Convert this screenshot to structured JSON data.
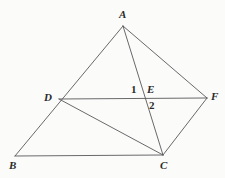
{
  "figure": {
    "canvas": {
      "width": 225,
      "height": 178
    },
    "background_color": "#fbfbfa",
    "stroke_color": "#58585a",
    "stroke_width": 0.9,
    "label_color": "#2b2b2b",
    "points": {
      "A": {
        "label": "A",
        "x": 123,
        "y": 26,
        "label_x": 119,
        "label_y": 9
      },
      "B": {
        "label": "B",
        "x": 15,
        "y": 156,
        "label_x": 9,
        "label_y": 160
      },
      "C": {
        "label": "C",
        "x": 163,
        "y": 155,
        "label_x": 160,
        "label_y": 160
      },
      "D": {
        "label": "D",
        "x": 59,
        "y": 99,
        "label_x": 44,
        "label_y": 92
      },
      "E": {
        "label": "E",
        "x": 144,
        "y": 99,
        "label_x": 147,
        "label_y": 84
      },
      "F": {
        "label": "F",
        "x": 207,
        "y": 98,
        "label_x": 211,
        "label_y": 91
      }
    },
    "angle_marks": [
      {
        "label": "1",
        "x": 131,
        "y": 84
      },
      {
        "label": "2",
        "x": 149,
        "y": 100
      }
    ],
    "segments": [
      {
        "name": "segment-AB",
        "from": "A",
        "to": "B"
      },
      {
        "name": "segment-AC",
        "from": "A",
        "to": "C"
      },
      {
        "name": "segment-AF",
        "from": "A",
        "to": "F"
      },
      {
        "name": "segment-BC",
        "from": "B",
        "to": "C"
      },
      {
        "name": "segment-DF",
        "from": "D",
        "to": "F"
      },
      {
        "name": "segment-DC",
        "from": "D",
        "to": "C"
      },
      {
        "name": "segment-CF",
        "from": "C",
        "to": "F"
      }
    ]
  }
}
